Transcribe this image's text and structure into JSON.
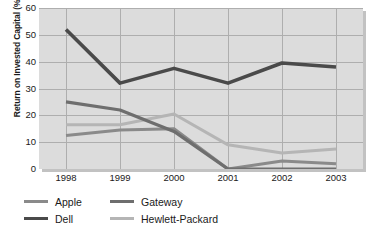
{
  "chart_data": {
    "type": "line",
    "title": "",
    "xlabel": "",
    "ylabel": "Return on Invested Capital (%)",
    "categories": [
      "1998",
      "1999",
      "2000",
      "2001",
      "2002",
      "2003"
    ],
    "ylim": [
      0,
      60
    ],
    "yticks": [
      "0",
      "10",
      "20",
      "30",
      "40",
      "50",
      "60"
    ],
    "grid": true,
    "legend_position": "bottom-left",
    "series": [
      {
        "name": "Apple",
        "color": "#8a8a8a",
        "values": [
          12.5,
          14.5,
          15.0,
          0.0,
          3.0,
          2.0
        ]
      },
      {
        "name": "Dell",
        "color": "#4a4a4a",
        "values": [
          52.0,
          32.0,
          37.5,
          32.0,
          39.5,
          38.0
        ]
      },
      {
        "name": "Gateway",
        "color": "#6e6e6e",
        "values": [
          25.0,
          22.0,
          14.0,
          0.0,
          0.0,
          0.0
        ]
      },
      {
        "name": "Hewlett-Packard",
        "color": "#b5b5b5",
        "values": [
          16.5,
          16.5,
          20.5,
          9.0,
          6.0,
          7.5
        ]
      }
    ]
  },
  "legend": {
    "rows": [
      {
        "left": "Apple",
        "right": "Gateway"
      },
      {
        "left": "Dell",
        "right": "Hewlett-Packard"
      }
    ]
  },
  "colors": {
    "plot_background": "#dcdcdc",
    "gridline": "#aeaeae",
    "text": "#1a1a1a",
    "shadow": "#c2c2c2"
  }
}
